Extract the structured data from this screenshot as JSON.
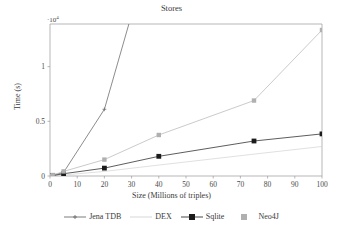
{
  "chart_data": {
    "type": "line",
    "title": "Stores",
    "xlabel": "Size (Millions of triples)",
    "ylabel": "Time (s)",
    "y_multiplier_label": "·10",
    "y_multiplier_exp": "4",
    "xlim": [
      0,
      100
    ],
    "ylim": [
      0,
      13900
    ],
    "grid": false,
    "legend_position": "bottom",
    "xticks": [
      0,
      10,
      20,
      30,
      40,
      50,
      60,
      70,
      80,
      90,
      100
    ],
    "xtick_labels": [
      "0",
      "10",
      "20",
      "30",
      "40",
      "50",
      "60",
      "70",
      "80",
      "90",
      "100"
    ],
    "yticks": [
      0,
      5000,
      10000
    ],
    "ytick_labels": [
      "0",
      "0.5",
      "1"
    ],
    "series": [
      {
        "name": "Jena TDB",
        "color": "#6e6e6e",
        "marker": "plus",
        "x": [
          0,
          1,
          5,
          20,
          29
        ],
        "values": [
          0,
          60,
          330,
          6100,
          13900
        ]
      },
      {
        "name": "DEX",
        "color": "#d2d2d2",
        "marker": "none",
        "x": [
          0,
          1,
          5,
          20,
          40,
          75,
          100
        ],
        "values": [
          0,
          20,
          90,
          420,
          1000,
          2000,
          2700
        ]
      },
      {
        "name": "Sqlite",
        "color": "#333333",
        "marker": "square-filled",
        "x": [
          0,
          1,
          5,
          20,
          40,
          75,
          100
        ],
        "values": [
          0,
          40,
          210,
          720,
          1800,
          3200,
          3850
        ]
      },
      {
        "name": "Neo4J",
        "color": "#bdbdbd",
        "marker": "square-gray",
        "x": [
          0,
          1,
          5,
          20,
          40,
          75,
          100
        ],
        "values": [
          0,
          90,
          420,
          1500,
          3750,
          6900,
          13350
        ]
      }
    ]
  },
  "legend": {
    "items": [
      {
        "label": "Jena TDB",
        "marker": "line-plus-marker",
        "color": "#6e6e6e"
      },
      {
        "label": "DEX",
        "marker": "line-plain",
        "color": "#d2d2d2"
      },
      {
        "label": "Sqlite",
        "marker": "line-square-marker",
        "color": "#333333"
      },
      {
        "label": "Neo4J",
        "marker": "square-marker-only",
        "color": "#bdbdbd"
      }
    ]
  }
}
